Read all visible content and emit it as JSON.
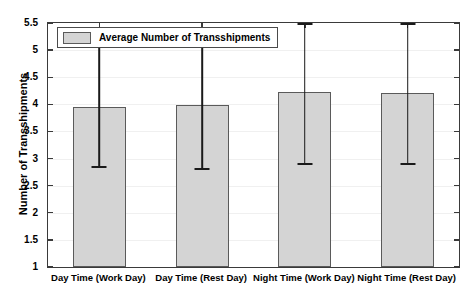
{
  "chart_data": {
    "type": "bar",
    "title": "",
    "xlabel": "",
    "ylabel": "Number of Transshipments",
    "categories": [
      "Day Time (Work Day)",
      "Day Time (Rest Day)",
      "Night Time (Work Day)",
      "Night Time (Rest Day)"
    ],
    "values": [
      3.96,
      3.99,
      4.23,
      4.21
    ],
    "error_low": [
      2.83,
      2.79,
      2.88,
      2.88
    ],
    "error_high": [
      5.08,
      5.19,
      5.62,
      5.54
    ],
    "ylim": [
      1,
      5.5
    ],
    "ytick_labels": [
      "1",
      "1.5",
      "2",
      "2.5",
      "3",
      "3.5",
      "4",
      "4.5",
      "5",
      "5.5"
    ],
    "ytick_values": [
      1,
      1.5,
      2,
      2.5,
      3,
      3.5,
      4,
      4.5,
      5,
      5.5
    ],
    "grid": true,
    "legend": {
      "position": "top-left",
      "entries": [
        "Average Number of Transshipments"
      ]
    },
    "series": [
      {
        "name": "Average Number of Transshipments",
        "values": [
          3.96,
          3.99,
          4.23,
          4.21
        ]
      }
    ],
    "colors": {
      "bar_fill": "#d4d4d4",
      "bar_edge": "#5a5a5a",
      "error_bar": "#1a1a1a",
      "axis": "#3a3a3a",
      "grid": "#f0f0f0",
      "text": "#000000"
    }
  }
}
